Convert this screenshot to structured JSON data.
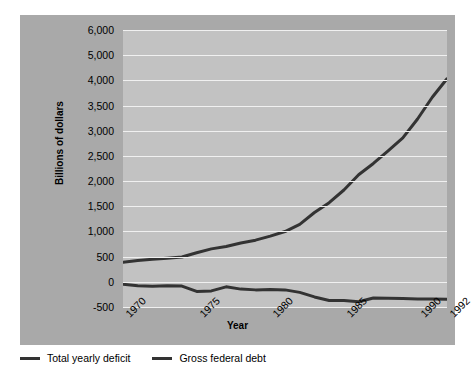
{
  "header_artifact": "",
  "chart_data": {
    "type": "line",
    "title": "",
    "xlabel": "Year",
    "ylabel": "Billions of dollars",
    "xlim": [
      1970,
      1992
    ],
    "ylim": [
      -500,
      6000
    ],
    "grid": true,
    "legend_position": "below",
    "y_ticks": [
      {
        "label": "6,000",
        "value": 6000
      },
      {
        "label": "5,000",
        "value": 5000
      },
      {
        "label": "4,000",
        "value": 4000
      },
      {
        "label": "3,500",
        "value": 3500
      },
      {
        "label": "3,000",
        "value": 3000
      },
      {
        "label": "2,500",
        "value": 2500
      },
      {
        "label": "2,000",
        "value": 2000
      },
      {
        "label": "1,500",
        "value": 1500
      },
      {
        "label": "1,000",
        "value": 1000
      },
      {
        "label": "500",
        "value": 500
      },
      {
        "label": "0",
        "value": 0
      },
      {
        "label": "-500",
        "value": -500
      }
    ],
    "x_ticks": [
      {
        "label": "1970",
        "value": 1970
      },
      {
        "label": "1975",
        "value": 1975
      },
      {
        "label": "1980",
        "value": 1980
      },
      {
        "label": "1985",
        "value": 1985
      },
      {
        "label": "1990",
        "value": 1990
      },
      {
        "label": "1992",
        "value": 1992
      }
    ],
    "x": [
      1970,
      1971,
      1972,
      1973,
      1974,
      1975,
      1976,
      1977,
      1978,
      1979,
      1980,
      1981,
      1982,
      1983,
      1984,
      1985,
      1986,
      1987,
      1988,
      1989,
      1990,
      1991,
      1992
    ],
    "series": [
      {
        "name": "Gross federal debt",
        "color": "#333333",
        "values": [
          389,
          424,
          449,
          470,
          492,
          576,
          654,
          700,
          772,
          827,
          908,
          998,
          1142,
          1377,
          1572,
          1823,
          2125,
          2350,
          2602,
          2857,
          3233,
          3665,
          4064
        ]
      },
      {
        "name": "Total yearly deficit",
        "color": "#333333",
        "values": [
          -50,
          -80,
          -90,
          -80,
          -85,
          -190,
          -180,
          -100,
          -145,
          -160,
          -155,
          -160,
          -210,
          -300,
          -370,
          -370,
          -395,
          -320,
          -325,
          -330,
          -340,
          -340,
          -345
        ]
      }
    ],
    "legend": [
      {
        "label": "Total yearly deficit",
        "color": "#333333"
      },
      {
        "label": "Gross federal debt",
        "color": "#333333"
      }
    ],
    "colors": {
      "figure_panel": "#a9a9a9",
      "plot_background": "#c2c2c2",
      "gridline": "#f0f0f0",
      "line": "#333333",
      "page_background": "#ffffff",
      "text": "#000000"
    }
  }
}
